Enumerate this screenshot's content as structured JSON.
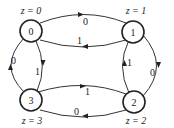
{
  "diagram": {
    "type": "state-diagram",
    "nodes": [
      {
        "id": "0",
        "label": "0",
        "output": "z = 0"
      },
      {
        "id": "1",
        "label": "1",
        "output": "z = 1"
      },
      {
        "id": "2",
        "label": "2",
        "output": "z = 2"
      },
      {
        "id": "3",
        "label": "3",
        "output": "z = 3"
      }
    ],
    "edges": [
      {
        "from": "0",
        "to": "1",
        "label": "0"
      },
      {
        "from": "1",
        "to": "0",
        "label": "1"
      },
      {
        "from": "1",
        "to": "2",
        "label": "0"
      },
      {
        "from": "2",
        "to": "1",
        "label": "1"
      },
      {
        "from": "3",
        "to": "2",
        "label": "1"
      },
      {
        "from": "2",
        "to": "3",
        "label": "0"
      },
      {
        "from": "0",
        "to": "3",
        "label": "1"
      },
      {
        "from": "3",
        "to": "0",
        "label": "0"
      }
    ]
  }
}
